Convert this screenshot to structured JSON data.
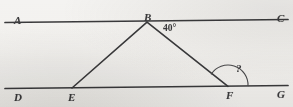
{
  "figure": {
    "kind": "geometry-diagram",
    "background_color": "#f4f3f1",
    "ink_color": "#3a3a3c",
    "width": 293,
    "height": 107
  },
  "points": [
    {
      "id": "A",
      "label": "A",
      "x": 14,
      "y": 15
    },
    {
      "id": "B",
      "label": "B",
      "x": 144,
      "y": 12
    },
    {
      "id": "C",
      "label": "C",
      "x": 277,
      "y": 13
    },
    {
      "id": "D",
      "label": "D",
      "x": 14,
      "y": 92
    },
    {
      "id": "E",
      "label": "E",
      "x": 68,
      "y": 92
    },
    {
      "id": "F",
      "label": "F",
      "x": 226,
      "y": 90
    },
    {
      "id": "G",
      "label": "G",
      "x": 277,
      "y": 89
    }
  ],
  "lines": [
    {
      "id": "AC",
      "name": "top-parallel-line",
      "from": "A",
      "to": "C",
      "x1": 5,
      "y1": 22.5,
      "x2": 288,
      "y2": 19.5
    },
    {
      "id": "DG",
      "name": "bottom-parallel-line",
      "from": "D",
      "to": "G",
      "x1": 5,
      "y1": 88.5,
      "x2": 288,
      "y2": 85.5
    }
  ],
  "segments": [
    {
      "id": "BE",
      "name": "segment-b-e",
      "x1": 147,
      "y1": 22.2,
      "x2": 72,
      "y2": 88.0
    },
    {
      "id": "BF",
      "name": "segment-b-f",
      "x1": 147,
      "y1": 22.2,
      "x2": 228,
      "y2": 86.3
    }
  ],
  "angles": [
    {
      "id": "angle-at-B",
      "vertex": "B",
      "label": "40°",
      "value": 40,
      "unit": "degrees",
      "label_x": 163,
      "label_y": 24,
      "has_arc": false
    },
    {
      "id": "angle-at-F",
      "vertex": "F",
      "label": "?",
      "value": null,
      "unit": "degrees",
      "label_x": 236,
      "label_y": 63,
      "has_arc": true,
      "arc_radius": 20,
      "arc_path": "M 211.1 74.4 A 20 20 0 0 1 248.0 86.1"
    }
  ]
}
